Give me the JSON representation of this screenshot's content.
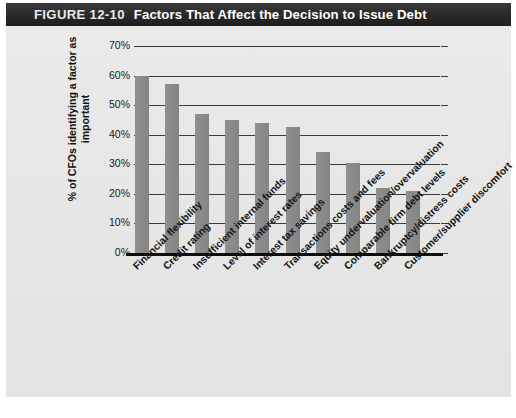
{
  "figure": {
    "number": "FIGURE 12-10",
    "title": "Factors That Affect the Decision to Issue Debt"
  },
  "colors": {
    "titlebar_dark": "#1d1d1d",
    "titlebar_light": "#3a3a3a",
    "panel_background": "#e8e8e8",
    "bar_fill": "#8a8a8a",
    "gridline": "#3b3b3b",
    "axis": "#0d0d0d",
    "text": "#141414"
  },
  "chart_data": {
    "type": "bar",
    "title": "Factors That Affect the Decision to Issue Debt",
    "xlabel": "",
    "ylabel": "% of CFOs identifying a factor as important",
    "ylim": [
      0,
      70
    ],
    "ytick_values": [
      0,
      10,
      20,
      30,
      40,
      50,
      60,
      70
    ],
    "ytick_labels": [
      "0%",
      "10%",
      "20%",
      "30%",
      "40%",
      "50%",
      "60%",
      "70%"
    ],
    "grid": true,
    "legend": false,
    "categories": [
      "Financial flexibility",
      "Credit rating",
      "Insufficient internal funds",
      "Level of interest rates",
      "Interest tax savings",
      "Transactions costs and fees",
      "Equity undervaluation/overvaluation",
      "Comparable firm debt levels",
      "Bankruptcy/distress costs",
      "Customer/supplier discomfort"
    ],
    "values": [
      60,
      57,
      47,
      45,
      44,
      42.5,
      34,
      30.5,
      22,
      21
    ],
    "value_labels": [
      "60%",
      "57%",
      "47%",
      "45%",
      "44%",
      "42.5%",
      "34%",
      "30.5%",
      "22%",
      "21%"
    ]
  }
}
